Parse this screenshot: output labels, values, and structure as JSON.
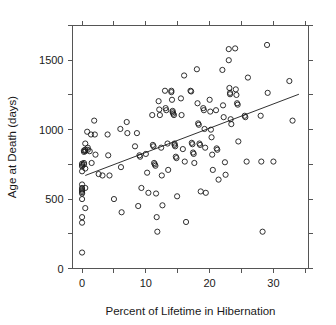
{
  "chart_data": {
    "type": "scatter",
    "title": "",
    "subtitle": "",
    "xlabel": "Percent of Lifetime in Hibernation",
    "ylabel": "Age at Death (days)",
    "xlim": [
      -1.5,
      35.5
    ],
    "ylim": [
      0,
      1750
    ],
    "x_ticks_labeled": [
      0,
      10,
      20,
      30
    ],
    "y_ticks_labeled": [
      0,
      500,
      1000,
      1500
    ],
    "x_ticks_minor": [
      5,
      15,
      25,
      35
    ],
    "y_ticks_minor": [
      250,
      750,
      1250,
      1750
    ],
    "x_tick_labels": [
      "0",
      "10",
      "20",
      "30"
    ],
    "y_tick_labels": [
      "0",
      "500",
      "1000",
      "1500"
    ],
    "grid": false,
    "legend": null,
    "legend_position": "none",
    "frame": "box",
    "marker": "open-circle",
    "annotations": [],
    "trend_line": {
      "name": "least-squares fit",
      "x_start": 0.5,
      "y_start": 670,
      "x_end": 34.0,
      "y_end": 1255,
      "slope": 17.5,
      "intercept": 661
    },
    "points": [
      [
        0.0,
        755
      ],
      [
        0.0,
        745
      ],
      [
        0.0,
        735
      ],
      [
        0.0,
        700
      ],
      [
        0.0,
        605
      ],
      [
        0.0,
        580
      ],
      [
        0.0,
        570
      ],
      [
        0.0,
        560
      ],
      [
        0.0,
        550
      ],
      [
        0.0,
        540
      ],
      [
        0.0,
        500
      ],
      [
        0.0,
        370
      ],
      [
        0.0,
        330
      ],
      [
        0.0,
        115
      ],
      [
        0.3,
        850
      ],
      [
        0.3,
        840
      ],
      [
        0.3,
        760
      ],
      [
        0.3,
        750
      ],
      [
        0.5,
        900
      ],
      [
        0.5,
        855
      ],
      [
        0.5,
        845
      ],
      [
        0.5,
        720
      ],
      [
        0.5,
        580
      ],
      [
        0.5,
        435
      ],
      [
        0.8,
        985
      ],
      [
        0.9,
        870
      ],
      [
        0.9,
        855
      ],
      [
        1.2,
        845
      ],
      [
        1.4,
        965
      ],
      [
        1.5,
        760
      ],
      [
        1.9,
        1065
      ],
      [
        2.0,
        965
      ],
      [
        2.1,
        820
      ],
      [
        2.6,
        680
      ],
      [
        3.2,
        670
      ],
      [
        4.0,
        965
      ],
      [
        4.1,
        815
      ],
      [
        4.3,
        670
      ],
      [
        5.0,
        500
      ],
      [
        6.0,
        1005
      ],
      [
        6.1,
        730
      ],
      [
        6.2,
        405
      ],
      [
        7.0,
        1055
      ],
      [
        7.1,
        975
      ],
      [
        8.3,
        880
      ],
      [
        8.6,
        975
      ],
      [
        8.8,
        450
      ],
      [
        9.0,
        815
      ],
      [
        9.1,
        805
      ],
      [
        9.3,
        580
      ],
      [
        10.0,
        825
      ],
      [
        10.2,
        690
      ],
      [
        10.4,
        545
      ],
      [
        11.0,
        1105
      ],
      [
        11.1,
        890
      ],
      [
        11.2,
        880
      ],
      [
        11.3,
        760
      ],
      [
        11.4,
        750
      ],
      [
        11.5,
        740
      ],
      [
        11.6,
        540
      ],
      [
        11.7,
        370
      ],
      [
        11.8,
        265
      ],
      [
        12.0,
        1205
      ],
      [
        12.1,
        1145
      ],
      [
        12.2,
        1105
      ],
      [
        12.4,
        870
      ],
      [
        12.5,
        670
      ],
      [
        12.6,
        455
      ],
      [
        13.0,
        1280
      ],
      [
        13.1,
        1155
      ],
      [
        13.2,
        1140
      ],
      [
        13.4,
        900
      ],
      [
        13.5,
        710
      ],
      [
        14.0,
        1280
      ],
      [
        14.0,
        1270
      ],
      [
        14.1,
        1215
      ],
      [
        14.2,
        1135
      ],
      [
        14.2,
        1125
      ],
      [
        14.3,
        1115
      ],
      [
        14.4,
        1105
      ],
      [
        14.5,
        900
      ],
      [
        14.5,
        890
      ],
      [
        14.6,
        880
      ],
      [
        14.7,
        805
      ],
      [
        14.8,
        795
      ],
      [
        14.9,
        520
      ],
      [
        15.5,
        1225
      ],
      [
        15.6,
        1105
      ],
      [
        15.8,
        860
      ],
      [
        16.0,
        1390
      ],
      [
        16.1,
        770
      ],
      [
        16.3,
        335
      ],
      [
        17.0,
        1280
      ],
      [
        17.1,
        1275
      ],
      [
        17.2,
        905
      ],
      [
        17.3,
        895
      ],
      [
        17.4,
        835
      ],
      [
        17.5,
        825
      ],
      [
        17.6,
        760
      ],
      [
        18.0,
        1435
      ],
      [
        18.1,
        1190
      ],
      [
        18.2,
        1045
      ],
      [
        18.3,
        1035
      ],
      [
        18.4,
        900
      ],
      [
        18.5,
        890
      ],
      [
        18.6,
        555
      ],
      [
        19.0,
        1155
      ],
      [
        19.1,
        1140
      ],
      [
        19.2,
        1005
      ],
      [
        19.3,
        870
      ],
      [
        19.4,
        545
      ],
      [
        20.0,
        1215
      ],
      [
        20.1,
        1130
      ],
      [
        20.2,
        1000
      ],
      [
        20.3,
        945
      ],
      [
        20.4,
        820
      ],
      [
        20.5,
        710
      ],
      [
        21.0,
        1140
      ],
      [
        21.1,
        865
      ],
      [
        21.2,
        855
      ],
      [
        21.4,
        640
      ],
      [
        22.0,
        1430
      ],
      [
        22.1,
        1175
      ],
      [
        22.2,
        1090
      ],
      [
        22.4,
        765
      ],
      [
        22.5,
        675
      ],
      [
        23.0,
        1580
      ],
      [
        23.0,
        1500
      ],
      [
        23.1,
        1300
      ],
      [
        23.2,
        1265
      ],
      [
        23.2,
        1255
      ],
      [
        23.3,
        1075
      ],
      [
        23.4,
        1040
      ],
      [
        24.0,
        1585
      ],
      [
        24.1,
        1290
      ],
      [
        24.2,
        1250
      ],
      [
        24.3,
        1190
      ],
      [
        24.4,
        1180
      ],
      [
        24.5,
        915
      ],
      [
        25.5,
        1100
      ],
      [
        25.6,
        1090
      ],
      [
        25.8,
        770
      ],
      [
        26.0,
        1375
      ],
      [
        28.0,
        1100
      ],
      [
        28.1,
        770
      ],
      [
        28.3,
        265
      ],
      [
        29.0,
        1610
      ],
      [
        29.1,
        1265
      ],
      [
        30.0,
        770
      ],
      [
        32.5,
        1350
      ],
      [
        33.0,
        1065
      ]
    ]
  }
}
